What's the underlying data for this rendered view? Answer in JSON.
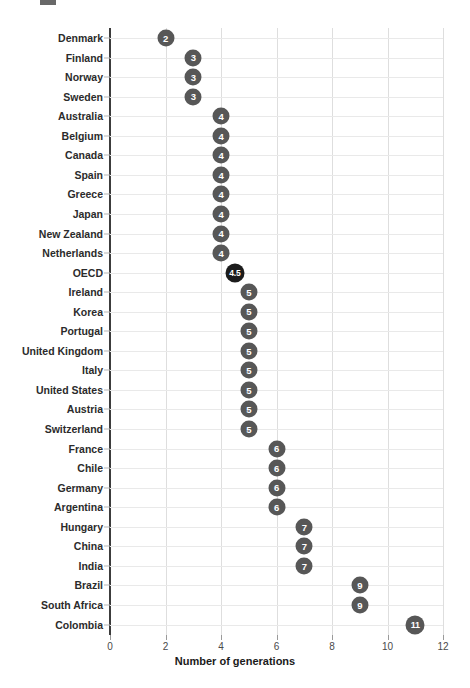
{
  "chart_data": {
    "type": "scatter",
    "title": "",
    "xlabel": "Number of generations",
    "ylabel": "",
    "xlim": [
      0,
      12
    ],
    "xticks": [
      0,
      2,
      4,
      6,
      8,
      10,
      12
    ],
    "xtick_labels": [
      "0",
      "2",
      "4",
      "6",
      "8",
      "10",
      "12"
    ],
    "grid": true,
    "legend": "none",
    "orientation": "horizontal",
    "highlight_category": "OECD",
    "colors": {
      "marker": "#575757",
      "marker_highlight": "#1c1c1c",
      "marker_text": "#ffffff",
      "axis": "#3c3c3c",
      "grid": "#e9e9e9",
      "text": "#1a1a1a"
    },
    "categories": [
      "Denmark",
      "Finland",
      "Norway",
      "Sweden",
      "Australia",
      "Belgium",
      "Canada",
      "Spain",
      "Greece",
      "Japan",
      "New Zealand",
      "Netherlands",
      "OECD",
      "Ireland",
      "Korea",
      "Portugal",
      "United Kingdom",
      "Italy",
      "United States",
      "Austria",
      "Switzerland",
      "France",
      "Chile",
      "Germany",
      "Argentina",
      "Hungary",
      "China",
      "India",
      "Brazil",
      "South Africa",
      "Colombia"
    ],
    "values": [
      2,
      3,
      3,
      3,
      4,
      4,
      4,
      4,
      4,
      4,
      4,
      4,
      4.5,
      5,
      5,
      5,
      5,
      5,
      5,
      5,
      5,
      6,
      6,
      6,
      6,
      7,
      7,
      7,
      9,
      9,
      11
    ],
    "value_labels": [
      "2",
      "3",
      "3",
      "3",
      "4",
      "4",
      "4",
      "4",
      "4",
      "4",
      "4",
      "4",
      "4.5",
      "5",
      "5",
      "5",
      "5",
      "5",
      "5",
      "5",
      "5",
      "6",
      "6",
      "6",
      "6",
      "7",
      "7",
      "7",
      "9",
      "9",
      "11"
    ]
  }
}
